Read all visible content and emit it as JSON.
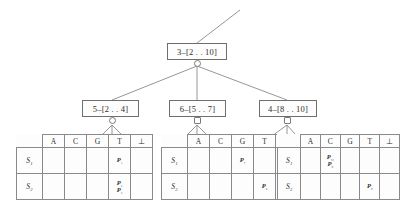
{
  "diagram": {
    "type": "suffix-tree-interval-tree",
    "root": {
      "label": "3–[2 . . 10]"
    },
    "children": [
      {
        "label": "5–[2 . . 4]"
      },
      {
        "label": "6–[5 . . 7]"
      },
      {
        "label": "4–[8 . . 10]"
      }
    ],
    "tables": [
      {
        "columns": [
          "A",
          "C",
          "G",
          "T",
          "⊥"
        ],
        "rows": [
          {
            "label": "S₁",
            "cells": [
              [],
              [],
              [],
              [
                "P₄"
              ],
              []
            ]
          },
          {
            "label": "S₂",
            "cells": [
              [],
              [],
              [],
              [
                "P₂",
                "P₃"
              ],
              []
            ]
          }
        ]
      },
      {
        "columns": [
          "A",
          "C",
          "G",
          "T",
          "⊥"
        ],
        "rows": [
          {
            "label": "S₁",
            "cells": [
              [],
              [],
              [
                "P₇"
              ],
              [],
              [
                "P₅"
              ]
            ]
          },
          {
            "label": "S₂",
            "cells": [
              [],
              [],
              [],
              [
                "P₆"
              ],
              []
            ]
          }
        ]
      },
      {
        "columns": [
          "A",
          "C",
          "G",
          "T",
          "⊥"
        ],
        "rows": [
          {
            "label": "S₁",
            "cells": [
              [],
              [
                "P₁₀",
                "P₉"
              ],
              [],
              [],
              []
            ]
          },
          {
            "label": "S₂",
            "cells": [
              [],
              [],
              [],
              [
                "P₈"
              ],
              []
            ]
          }
        ]
      }
    ],
    "colors": {
      "line": "#7a7a7a",
      "border": "#6e6e6e",
      "text": "#2e2e2e",
      "background": "#ffffff"
    }
  }
}
